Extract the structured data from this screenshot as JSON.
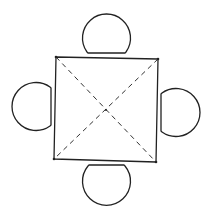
{
  "diagram": {
    "title": "Square table with four chairs",
    "colors": {
      "background": "#ffffff",
      "line": "#222222"
    },
    "table": {
      "shape": "square",
      "corners": [
        [
          56,
          57
        ],
        [
          158,
          59
        ],
        [
          156,
          162
        ],
        [
          54,
          159
        ]
      ],
      "diagonals": "dashed"
    },
    "chairs": [
      {
        "position": "top",
        "center": [
          107,
          33
        ],
        "radius": 24,
        "flat_edge": "bottom"
      },
      {
        "position": "left",
        "center": [
          32,
          106
        ],
        "radius": 24,
        "flat_edge": "right"
      },
      {
        "position": "right",
        "center": [
          180,
          112
        ],
        "radius": 24,
        "flat_edge": "left"
      },
      {
        "position": "bottom",
        "center": [
          106,
          187
        ],
        "radius": 24,
        "flat_edge": "top"
      }
    ]
  }
}
